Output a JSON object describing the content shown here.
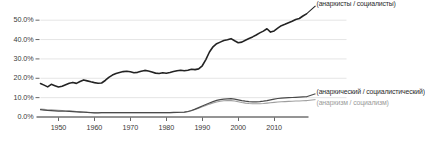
{
  "chart_data": {
    "type": "line",
    "title": "",
    "xlabel": "",
    "ylabel": "",
    "xlim": [
      1945,
      2019
    ],
    "ylim": [
      0,
      55
    ],
    "grid": true,
    "legend_position": "inline-right",
    "y_ticks": [
      "0.0%",
      "10.0%",
      "20.0%",
      "30.0%",
      "40.0%",
      "50.0%"
    ],
    "y_tick_values": [
      0,
      10,
      20,
      30,
      40,
      50
    ],
    "x_ticks": [
      "1950",
      "1960",
      "1970",
      "1980",
      "1990",
      "2000",
      "2010"
    ],
    "x_tick_values": [
      1950,
      1960,
      1970,
      1980,
      1990,
      2000,
      2010
    ],
    "x": [
      1945,
      1946,
      1947,
      1948,
      1949,
      1950,
      1951,
      1952,
      1953,
      1954,
      1955,
      1956,
      1957,
      1958,
      1959,
      1960,
      1961,
      1962,
      1963,
      1964,
      1965,
      1966,
      1967,
      1968,
      1969,
      1970,
      1971,
      1972,
      1973,
      1974,
      1975,
      1976,
      1977,
      1978,
      1979,
      1980,
      1981,
      1982,
      1983,
      1984,
      1985,
      1986,
      1987,
      1988,
      1989,
      1990,
      1991,
      1992,
      1993,
      1994,
      1995,
      1996,
      1997,
      1998,
      1999,
      2000,
      2001,
      2002,
      2003,
      2004,
      2005,
      2006,
      2007,
      2008,
      2009,
      2010,
      2011,
      2012,
      2013,
      2014,
      2015,
      2016,
      2017,
      2018,
      2019
    ],
    "series": [
      {
        "name": "(анархисты / социалисты)",
        "color": "#232323",
        "width": 1.6,
        "values": [
          17.0,
          16.2,
          15.3,
          16.6,
          15.9,
          15.2,
          15.6,
          16.4,
          17.2,
          17.6,
          17.1,
          18.1,
          18.9,
          18.4,
          17.9,
          17.5,
          17.2,
          17.3,
          18.6,
          20.2,
          21.4,
          22.2,
          22.7,
          23.2,
          23.4,
          23.1,
          22.6,
          22.8,
          23.4,
          23.8,
          23.5,
          23.0,
          22.4,
          22.2,
          22.6,
          22.3,
          22.7,
          23.2,
          23.6,
          23.9,
          23.6,
          23.9,
          24.4,
          24.2,
          24.6,
          26.2,
          29.4,
          33.3,
          36.0,
          37.6,
          38.4,
          39.2,
          39.6,
          40.2,
          39.1,
          38.1,
          38.4,
          39.4,
          40.3,
          41.1,
          42.1,
          43.2,
          44.1,
          45.3,
          43.6,
          44.2,
          45.6,
          46.9,
          47.6,
          48.4,
          49.2,
          50.1,
          50.6,
          51.9,
          53.0
        ]
      },
      {
        "name": "(анархический / социалистический)",
        "color": "#4a4a4a",
        "width": 1.2,
        "values": [
          3.5,
          3.3,
          3.1,
          3.0,
          2.9,
          2.8,
          2.8,
          2.7,
          2.6,
          2.5,
          2.4,
          2.3,
          2.2,
          2.1,
          2.0,
          1.9,
          1.9,
          2.0,
          2.0,
          2.0,
          2.0,
          2.0,
          2.0,
          2.0,
          2.0,
          2.0,
          2.0,
          2.0,
          2.0,
          2.0,
          2.0,
          2.0,
          2.0,
          2.0,
          2.0,
          2.0,
          2.0,
          2.1,
          2.1,
          2.2,
          2.3,
          2.6,
          3.1,
          3.8,
          4.6,
          5.4,
          6.2,
          7.0,
          7.7,
          8.3,
          8.7,
          9.0,
          9.1,
          9.2,
          9.0,
          8.6,
          8.2,
          7.9,
          7.7,
          7.6,
          7.6,
          7.7,
          7.9,
          8.2,
          8.6,
          9.0,
          9.3,
          9.5,
          9.6,
          9.7,
          9.8,
          9.9,
          10.0,
          10.1,
          10.2
        ]
      },
      {
        "name": "(анархизм / социализм)",
        "color": "#9e9e9e",
        "width": 1.1,
        "values": [
          3.9,
          3.7,
          3.5,
          3.4,
          3.3,
          3.2,
          3.1,
          3.0,
          2.9,
          2.8,
          2.6,
          2.5,
          2.4,
          2.2,
          2.1,
          2.0,
          1.9,
          1.9,
          2.0,
          2.0,
          2.0,
          2.0,
          2.0,
          2.0,
          2.0,
          2.0,
          2.0,
          2.0,
          2.0,
          2.0,
          2.0,
          2.0,
          2.0,
          2.0,
          2.0,
          2.0,
          2.0,
          2.0,
          2.1,
          2.1,
          2.2,
          2.5,
          3.0,
          3.6,
          4.3,
          5.0,
          5.7,
          6.4,
          7.0,
          7.5,
          7.9,
          8.1,
          8.2,
          8.2,
          8.0,
          7.6,
          7.2,
          6.9,
          6.7,
          6.6,
          6.6,
          6.6,
          6.7,
          6.9,
          7.1,
          7.3,
          7.5,
          7.6,
          7.7,
          7.8,
          7.9,
          8.0,
          8.0,
          8.1,
          8.2
        ]
      }
    ],
    "axis_color": "#2b2b2b",
    "grid_color": "#dedede"
  },
  "labels": {
    "series1": "(анархисты / социалисты)",
    "series2": "(анархический / социалистический)",
    "series3": "(анархизм / социализм)"
  }
}
